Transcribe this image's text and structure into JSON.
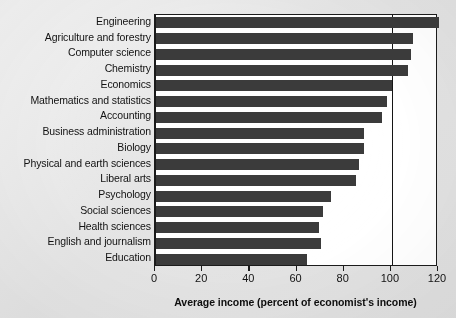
{
  "chart_data": {
    "type": "bar",
    "orientation": "horizontal",
    "title": "",
    "xlabel": "Average income (percent of economist's income)",
    "ylabel": "",
    "xlim": [
      0,
      120
    ],
    "xticks": [
      0,
      20,
      40,
      60,
      80,
      100,
      120
    ],
    "xtick_labels": [
      "0",
      "20",
      "40",
      "60",
      "80",
      "100",
      "120"
    ],
    "grid": false,
    "legend": null,
    "reference_lines": [
      {
        "x": 100,
        "label": "",
        "color": "#151515"
      }
    ],
    "bar_color": "#3b3b3b",
    "categories": [
      "Engineering",
      "Agriculture and forestry",
      "Computer science",
      "Chemistry",
      "Economics",
      "Mathematics and statistics",
      "Accounting",
      "Business administration",
      "Biology",
      "Physical and earth sciences",
      "Liberal arts",
      "Psychology",
      "Social sciences",
      "Health sciences",
      "English and journalism",
      "Education"
    ],
    "values": [
      120,
      109,
      108,
      107,
      100,
      98,
      96,
      88,
      88,
      86,
      85,
      74,
      71,
      69,
      70,
      64
    ]
  },
  "axis": {
    "x_title": "Average income (percent of economist's income)"
  }
}
